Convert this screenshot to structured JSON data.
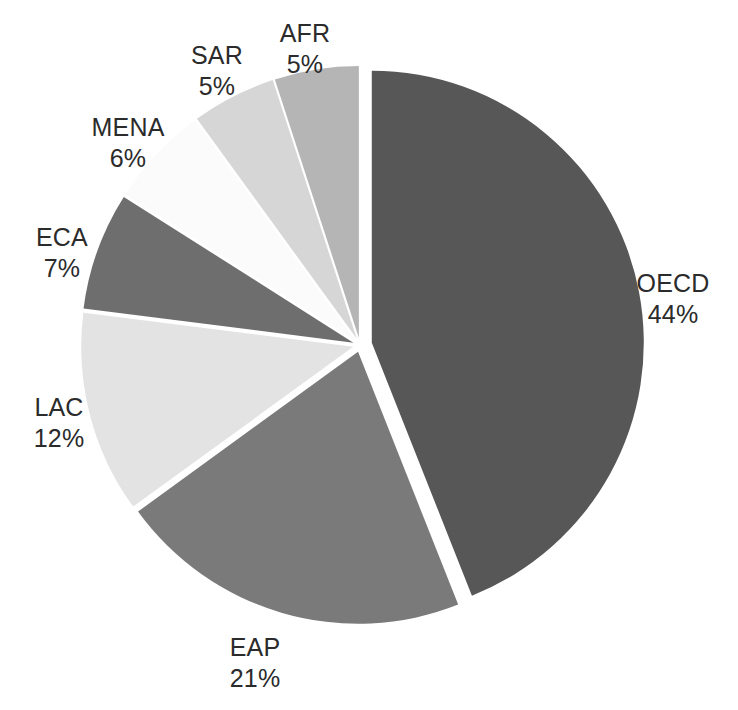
{
  "chart_data": {
    "type": "pie",
    "title": "",
    "subtitle": "",
    "xlabel": "",
    "ylabel": "",
    "legend_position": "none",
    "grid": false,
    "label_format": "name + percent",
    "exploded": true,
    "start_angle_deg": 0,
    "direction": "counter-clockwise",
    "categories": [
      "OECD",
      "EAP",
      "LAC",
      "ECA",
      "MENA",
      "SAR",
      "AFR"
    ],
    "values": [
      44,
      21,
      12,
      7,
      6,
      5,
      5
    ],
    "units": "percent",
    "total": 100,
    "slices": [
      {
        "name": "OECD",
        "value": 44,
        "percent_label": "44%",
        "color": "#575757"
      },
      {
        "name": "EAP",
        "value": 21,
        "percent_label": "21%",
        "color": "#7a7a7a"
      },
      {
        "name": "LAC",
        "value": 12,
        "percent_label": "12%",
        "color": "#e3e3e3"
      },
      {
        "name": "ECA",
        "value": 7,
        "percent_label": "7%",
        "color": "#6e6e6e"
      },
      {
        "name": "MENA",
        "value": 6,
        "percent_label": "6%",
        "color": "#fbfbfb"
      },
      {
        "name": "SAR",
        "value": 5,
        "percent_label": "5%",
        "color": "#d6d6d6"
      },
      {
        "name": "AFR",
        "value": 5,
        "percent_label": "5%",
        "color": "#b5b5b5"
      }
    ]
  },
  "labels": {
    "oecd": {
      "name": "OECD",
      "percent": "44%"
    },
    "eap": {
      "name": "EAP",
      "percent": "21%"
    },
    "lac": {
      "name": "LAC",
      "percent": "12%"
    },
    "eca": {
      "name": "ECA",
      "percent": "7%"
    },
    "mena": {
      "name": "MENA",
      "percent": "6%"
    },
    "sar": {
      "name": "SAR",
      "percent": "5%"
    },
    "afr": {
      "name": "AFR",
      "percent": "5%"
    }
  },
  "style": {
    "background": "#ffffff",
    "label_color": "#2b2b2b",
    "separator_color": "#ffffff"
  }
}
